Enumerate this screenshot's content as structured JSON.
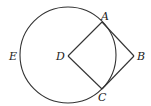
{
  "diagram": {
    "type": "geometry",
    "circle": {
      "cx": 68,
      "cy": 55,
      "r": 48,
      "stroke": "#333333"
    },
    "points": {
      "A": {
        "x": 102,
        "y": 22,
        "label": "A",
        "lx": 101,
        "ly": 20
      },
      "B": {
        "x": 134,
        "y": 56,
        "label": "B",
        "lx": 137,
        "ly": 60
      },
      "C": {
        "x": 102,
        "y": 89,
        "label": "C",
        "lx": 98,
        "ly": 101
      },
      "D": {
        "x": 68,
        "y": 56,
        "label": "D",
        "lx": 56,
        "ly": 60
      },
      "E": {
        "label": "E",
        "lx": 9,
        "ly": 60
      }
    },
    "segments": [
      [
        "D",
        "A"
      ],
      [
        "A",
        "B"
      ],
      [
        "B",
        "C"
      ],
      [
        "C",
        "D"
      ]
    ]
  }
}
